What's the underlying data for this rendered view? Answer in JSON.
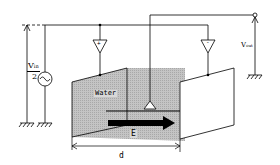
{
  "diagram": {
    "type": "electrode-measurement-circuit",
    "labels": {
      "vin_num": "V",
      "vin_sub": "in",
      "vin_den": "2",
      "vout": "V",
      "vout_sub": "out",
      "water": "Water",
      "field": "E",
      "distance": "d",
      "plus": "+",
      "minus": "-"
    },
    "colors": {
      "line": "#000000",
      "water_fill": "#b8b8b8",
      "plate_fill": "#ffffff",
      "background": "#ffffff"
    }
  }
}
